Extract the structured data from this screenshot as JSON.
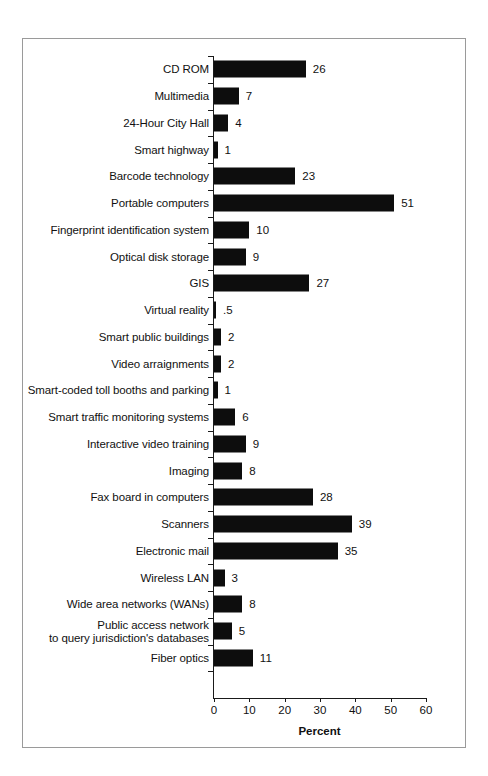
{
  "chart_data": {
    "type": "bar",
    "orientation": "horizontal",
    "title": "",
    "xlabel": "Percent",
    "ylabel": "",
    "xlim": [
      0,
      60
    ],
    "xticks": [
      0,
      10,
      20,
      30,
      40,
      50,
      60
    ],
    "grid": false,
    "legend": null,
    "bar_color": "#0d0d0d",
    "categories": [
      "CD ROM",
      "Multimedia",
      "24-Hour City Hall",
      "Smart highway",
      "Barcode technology",
      "Portable computers",
      "Fingerprint identification system",
      "Optical disk storage",
      "GIS",
      "Virtual reality",
      "Smart public buildings",
      "Video arraignments",
      "Smart-coded toll booths and parking",
      "Smart traffic monitoring systems",
      "Interactive video training",
      "Imaging",
      "Fax board in computers",
      "Scanners",
      "Electronic mail",
      "Wireless LAN",
      "Wide area networks (WANs)",
      "Public access network\nto query jurisdiction's databases",
      "Fiber optics"
    ],
    "values": [
      26,
      7,
      4,
      1,
      23,
      51,
      10,
      9,
      27,
      0.5,
      2,
      2,
      1,
      6,
      9,
      8,
      28,
      39,
      35,
      3,
      8,
      5,
      11
    ],
    "value_labels": [
      "26",
      "7",
      "4",
      "1",
      "23",
      "51",
      "10",
      "9",
      "27",
      ".5",
      "2",
      "2",
      "1",
      "6",
      "9",
      "8",
      "28",
      "39",
      "35",
      "3",
      "8",
      "5",
      "11"
    ]
  },
  "axis": {
    "x_title": "Percent",
    "tick_labels": [
      "0",
      "10",
      "20",
      "30",
      "40",
      "50",
      "60"
    ]
  }
}
